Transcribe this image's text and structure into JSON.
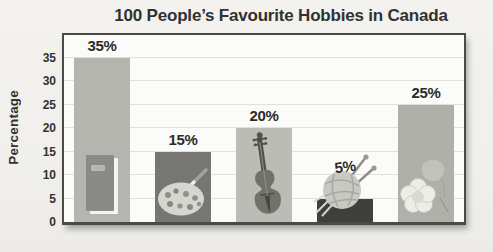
{
  "chart_data": {
    "type": "bar",
    "title": "100 People’s Favourite Hobbies in Canada",
    "ylabel": "Percentage",
    "xlabel": "",
    "categories": [
      "reading-book",
      "paint-palette",
      "violin-music",
      "knitting-yarn",
      "gardening-flowers"
    ],
    "values": [
      35,
      15,
      20,
      5,
      25
    ],
    "value_labels": [
      "35%",
      "15%",
      "20%",
      "5%",
      "25%"
    ],
    "yticks": [
      0,
      5,
      10,
      15,
      20,
      25,
      30,
      35
    ],
    "ylim": [
      0,
      40
    ],
    "grid": "horizontal",
    "legend": "none",
    "bar_colors": [
      "#b5b5b0",
      "#767672",
      "#bcbcb6",
      "#3f3f3c",
      "#b0b0aa"
    ],
    "accent_text_color": "#2b2b29"
  }
}
